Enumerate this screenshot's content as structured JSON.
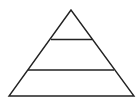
{
  "diagram": {
    "type": "pyramid",
    "tiers": 3,
    "stroke_color": "#222222",
    "fill_color": "#ffffff",
    "background": "#ffffff",
    "apex": [
      71,
      10
    ],
    "base_left": [
      9,
      96
    ],
    "base_right": [
      134,
      96
    ],
    "dividers": [
      {
        "y": 39.5,
        "x1": 51,
        "x2": 92
      },
      {
        "y": 70,
        "x1": 28,
        "x2": 114
      }
    ],
    "labels": []
  }
}
